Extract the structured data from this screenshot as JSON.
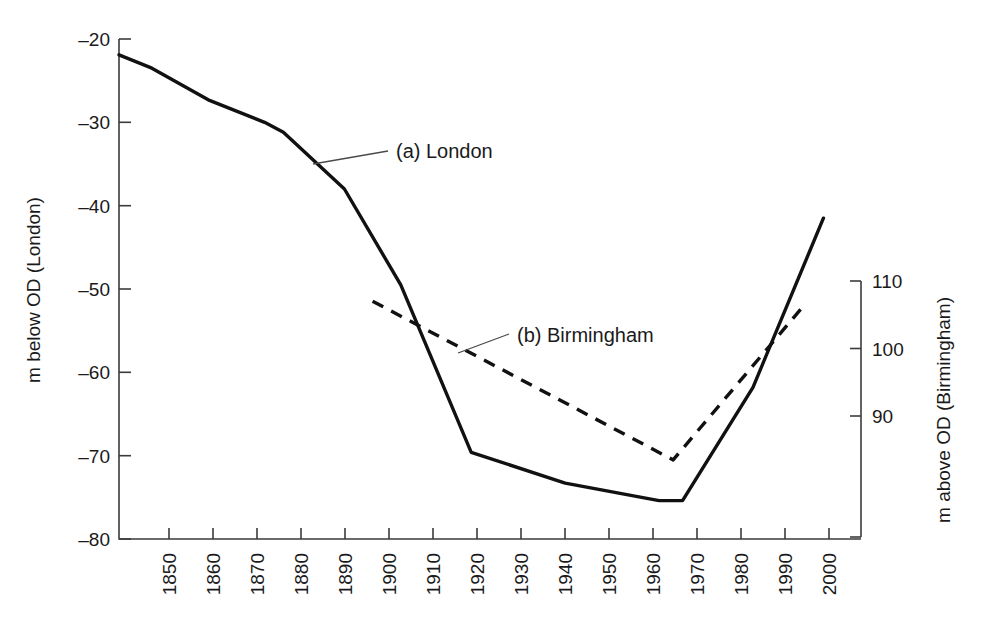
{
  "chart_data": {
    "type": "line",
    "title": "",
    "subtitle": "",
    "xlabel": "",
    "ylabel": "m below OD (London)",
    "y2label": "m above OD (Birmingham)",
    "xlim": [
      1845,
      2003
    ],
    "ylim": [
      -80,
      -20
    ],
    "y2lim": [
      75,
      113
    ],
    "grid": false,
    "legend_position": "inline-annotations",
    "x_ticks": [
      1850,
      1860,
      1870,
      1880,
      1890,
      1900,
      1910,
      1920,
      1930,
      1940,
      1950,
      1960,
      1970,
      1980,
      1990,
      2000
    ],
    "x_tick_labels": [
      "1850",
      "1860",
      "1870",
      "1880",
      "1890",
      "1900",
      "1910",
      "1920",
      "1930",
      "1940",
      "1950",
      "1960",
      "1970",
      "1980",
      "1990",
      "2000"
    ],
    "y_ticks": [
      -20,
      -30,
      -40,
      -50,
      -60,
      -70,
      -80
    ],
    "y_tick_labels": [
      "–20",
      "–30",
      "–40",
      "–50",
      "–60",
      "–70",
      "–80"
    ],
    "y2_ticks": [
      110,
      100,
      90
    ],
    "y2_tick_labels": [
      "110",
      "100",
      "90"
    ],
    "annotations": [
      {
        "name": "london-annotation",
        "text": "(a) London",
        "x": 1895,
        "y": -35.8
      },
      {
        "name": "birmingham-annotation",
        "text": "(b) Birmingham",
        "x": 1939,
        "y": -55.4
      }
    ],
    "series": [
      {
        "name": "(a) London",
        "axis": "left",
        "style": "solid",
        "label": "(a) London",
        "x": [
          1845,
          1852,
          1864,
          1876,
          1880,
          1893,
          1905,
          1920,
          1940,
          1960,
          1965,
          1980,
          1995
        ],
        "y": [
          -21.9,
          -23.5,
          -27.3,
          -30.0,
          -31.2,
          -38.0,
          -49.5,
          -69.6,
          -73.3,
          -75.4,
          -75.4,
          -61.8,
          -41.5
        ]
      },
      {
        "name": "(b) Birmingham",
        "axis": "right",
        "style": "dashed",
        "label": "(b) Birmingham",
        "x": [
          1899,
          1963,
          1991
        ],
        "y": [
          107.0,
          83.5,
          106.5
        ]
      }
    ]
  },
  "figure": {
    "background_color": "#ffffff",
    "line_color": "#111111",
    "axis_color": "#3b3b3b"
  }
}
